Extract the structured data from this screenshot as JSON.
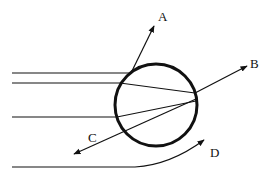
{
  "diagram": {
    "colors": {
      "stroke": "#111111",
      "background": "#ffffff"
    },
    "sphere": {
      "cx": 156,
      "cy": 105,
      "r": 41
    },
    "labels": {
      "a": "A",
      "b": "B",
      "c": "C",
      "d": "D"
    }
  }
}
